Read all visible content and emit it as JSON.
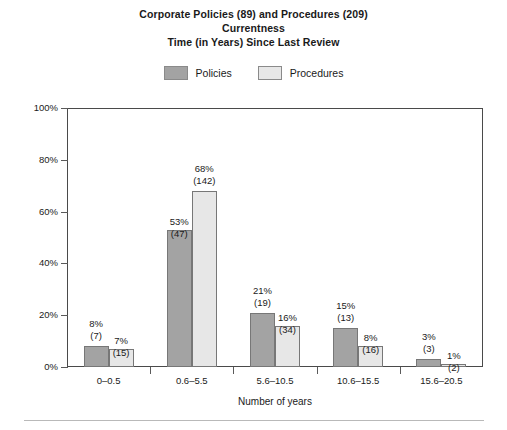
{
  "chart_data": {
    "type": "bar",
    "title": "Corporate Policies (89) and Procedures (209)\nCurrentness\nTime (in Years) Since Last Review",
    "title_lines": [
      "Corporate Policies (89) and Procedures (209)",
      "Currentness",
      "Time (in Years) Since Last Review"
    ],
    "xlabel": "Number of years",
    "ylabel": "Percentage of documents (number)",
    "ylim": [
      0,
      100
    ],
    "ytick_labels": [
      "0%",
      "20%",
      "40%",
      "60%",
      "80%",
      "100%"
    ],
    "ytick_values": [
      0,
      20,
      40,
      60,
      80,
      100
    ],
    "grid": false,
    "legend_position": "top-center",
    "categories": [
      "0–0.5",
      "0.6–5.5",
      "5.6–10.5",
      "10.6–15.5",
      "15.6–20.5"
    ],
    "series": [
      {
        "name": "Policies",
        "color": "#a3a3a3",
        "values": [
          8,
          53,
          21,
          15,
          3
        ],
        "counts": [
          7,
          47,
          19,
          13,
          3
        ],
        "labels": [
          "8%",
          "53%",
          "21%",
          "15%",
          "3%"
        ],
        "count_labels": [
          "(7)",
          "(47)",
          "(19)",
          "(13)",
          "(3)"
        ]
      },
      {
        "name": "Procedures",
        "color": "#e7e7e7",
        "values": [
          7,
          68,
          16,
          8,
          1
        ],
        "counts": [
          15,
          142,
          34,
          16,
          2
        ],
        "labels": [
          "7%",
          "68%",
          "16%",
          "8%",
          "1%"
        ],
        "count_labels": [
          "(15)",
          "(142)",
          "(34)",
          "(16)",
          "(2)"
        ]
      }
    ]
  },
  "legend": {
    "entries": [
      {
        "label": "Policies",
        "color": "#a3a3a3"
      },
      {
        "label": "Procedures",
        "color": "#e7e7e7"
      }
    ]
  }
}
